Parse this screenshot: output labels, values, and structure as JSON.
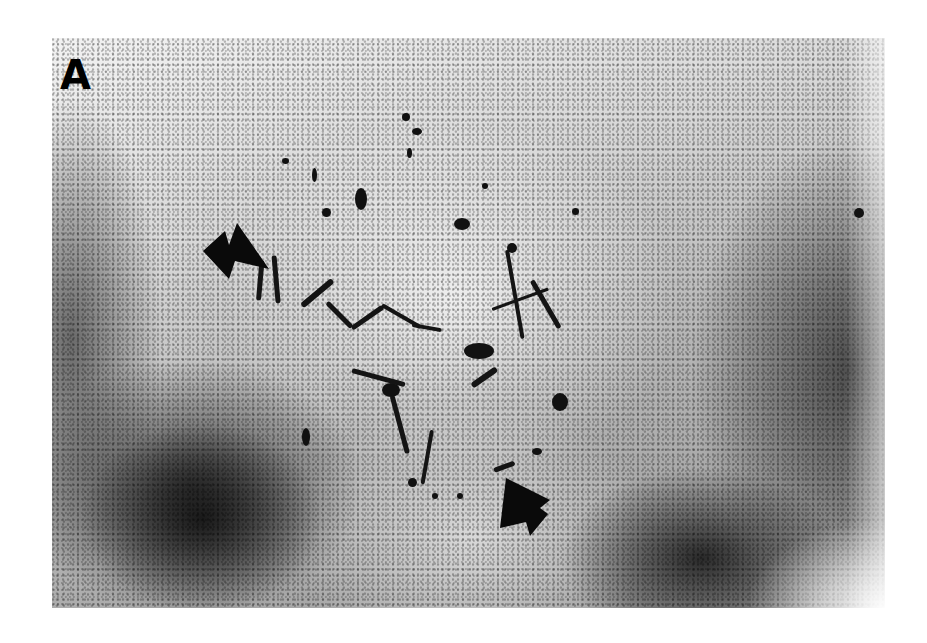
{
  "figure": {
    "panel_label": "A",
    "annotations": [
      {
        "name": "arrowhead-left",
        "direction": "pointing right-down",
        "position": {
          "x": 205,
          "y": 225
        }
      },
      {
        "name": "arrowhead-bottom",
        "direction": "pointing up-left",
        "position": {
          "x": 500,
          "y": 480
        }
      }
    ],
    "colors": {
      "background": "#ffffff",
      "stain": "#111111",
      "tissue_light": "#f2f2f2",
      "tissue_dark": "#2a2a2a"
    }
  }
}
